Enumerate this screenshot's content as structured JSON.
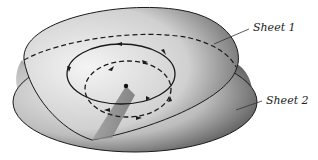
{
  "figure": {
    "labels": {
      "sheet1": "Sheet 1",
      "sheet2": "Sheet 2"
    },
    "colors": {
      "outline": "#1a1a1a",
      "sheet_light": "#e4e4e4",
      "sheet_dark": "#5a5a5a",
      "background": "#ffffff"
    },
    "elements": {
      "sheets": 2,
      "paths": [
        "solid-outer-loop",
        "dashed-inner-loop",
        "dashed-sheet-boundary"
      ],
      "branch_point": "center-dot",
      "branch_cut": "shaded-wedge"
    }
  }
}
